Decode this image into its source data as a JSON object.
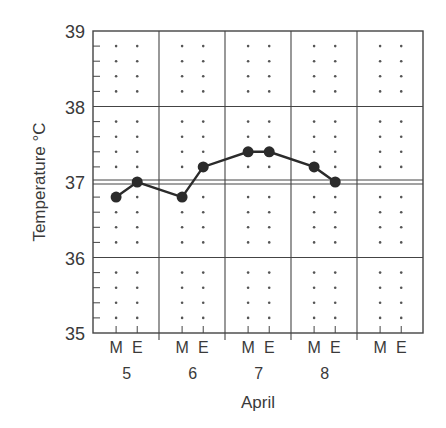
{
  "chart_data": {
    "type": "line",
    "title": "",
    "xlabel": "April",
    "ylabel": "Temperature °C",
    "ylim": [
      35,
      39
    ],
    "yticks": [
      35,
      36,
      37,
      38,
      39
    ],
    "minor_y_step": 0.2,
    "grid": true,
    "legend": null,
    "reference_line": {
      "value": 37,
      "style": "double"
    },
    "days": [
      "5",
      "6",
      "7",
      "8",
      ""
    ],
    "slot_labels": [
      "M",
      "E"
    ],
    "categories": [
      "5 M",
      "5 E",
      "6 M",
      "6 E",
      "7 M",
      "7 E",
      "8 M",
      "8 E"
    ],
    "series": [
      {
        "name": "Temperature",
        "values": [
          36.8,
          37.0,
          36.8,
          37.2,
          37.4,
          37.4,
          37.2,
          37.0
        ]
      }
    ]
  },
  "colors": {
    "line": "#2b2b2b",
    "grid": "#444444",
    "dots": "#555555",
    "text": "#3a3a3a"
  }
}
